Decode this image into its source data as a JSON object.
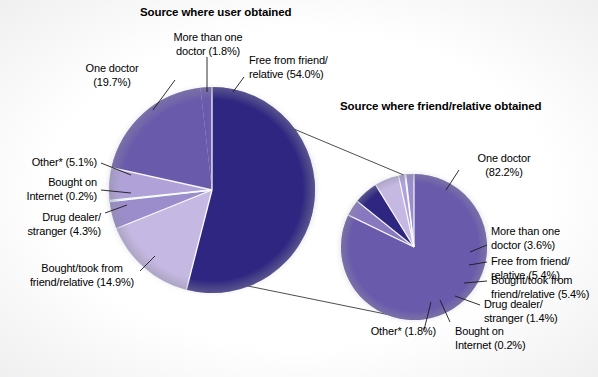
{
  "chart_data": [
    {
      "type": "pie",
      "title": "Source where user obtained",
      "categories": [
        "Free from friend/relative",
        "Bought/took from friend/relative",
        "Drug dealer/stranger",
        "Bought on Internet",
        "Other*",
        "One doctor",
        "More than one doctor"
      ],
      "values": [
        54.0,
        14.9,
        4.3,
        0.2,
        5.1,
        19.7,
        1.8
      ],
      "labels": [
        "Free from friend/ relative (54.0%)",
        "Bought/took from friend/relative (14.9%)",
        "Drug dealer/ stranger (4.3%)",
        "Bought on Internet (0.2%)",
        "Other* (5.1%)",
        "One doctor (19.7%)",
        "More than one doctor (1.8%)"
      ],
      "colors": [
        "#2e2680",
        "#c5b8e2",
        "#9b8ccb",
        "#7fd0ef",
        "#b0a2d8",
        "#6a5aab",
        "#6a5aab"
      ],
      "legend": "none",
      "grid": false
    },
    {
      "type": "pie",
      "title": "Source where friend/relative obtained",
      "categories": [
        "One doctor",
        "More than one doctor",
        "Free from friend/relative",
        "Bought/took from friend/relative",
        "Drug dealer/stranger",
        "Bought on Internet",
        "Other*"
      ],
      "values": [
        82.2,
        3.6,
        5.4,
        5.4,
        1.4,
        0.2,
        1.8
      ],
      "labels": [
        "One doctor (82.2%)",
        "More than one doctor (3.6%)",
        "Free from friend/ relative (5.4%)",
        "Bought/took from friend/relative (5.4%)",
        "Drug dealer/ stranger (1.4%)",
        "Bought on Internet (0.2%)",
        "Other* (1.8%)"
      ],
      "colors": [
        "#6a5aab",
        "#8878bf",
        "#2e2680",
        "#c5b8e2",
        "#b0a2d8",
        "#7fd0ef",
        "#9b8ccb"
      ],
      "legend": "none",
      "grid": false
    }
  ],
  "left_chart": {
    "title": "Source where user obtained",
    "labels": {
      "more_than_one_doctor_l1": "More than one",
      "more_than_one_doctor_l2": "doctor (1.8%)",
      "free_from_friend_l1": "Free from friend/",
      "free_from_friend_l2": "relative (54.0%)",
      "one_doctor_l1": "One doctor",
      "one_doctor_l2": "(19.7%)",
      "other_l1": "Other* (5.1%)",
      "bought_internet_l1": "Bought on",
      "bought_internet_l2": "Internet (0.2%)",
      "drug_dealer_l1": "Drug dealer/",
      "drug_dealer_l2": "stranger (4.3%)",
      "bought_took_l1": "Bought/took from",
      "bought_took_l2": "friend/relative (14.9%)"
    }
  },
  "right_chart": {
    "title": "Source where friend/relative obtained",
    "labels": {
      "one_doctor_l1": "One doctor",
      "one_doctor_l2": "(82.2%)",
      "more_than_one_doctor_l1": "More than one",
      "more_than_one_doctor_l2": "doctor (3.6%)",
      "free_from_friend_l1": "Free from friend/",
      "free_from_friend_l2": "relative (5.4%)",
      "bought_took_l1": "Bought/took from",
      "bought_took_l2": "friend/relative (5.4%)",
      "drug_dealer_l1": "Drug dealer/",
      "drug_dealer_l2": "stranger (1.4%)",
      "bought_internet_l1": "Bought on",
      "bought_internet_l2": "Internet (0.2%)",
      "other_l1": "Other* (1.8%)"
    }
  },
  "palette": {
    "dark_indigo": "#2e2680",
    "medium_purple": "#6a5aab",
    "mid_purple": "#8878bf",
    "soft_purple": "#9b8ccb",
    "light_purple": "#b0a2d8",
    "lavender": "#c5b8e2",
    "cyan": "#7fd0ef",
    "background": "#ffffff",
    "text": "#000000"
  }
}
